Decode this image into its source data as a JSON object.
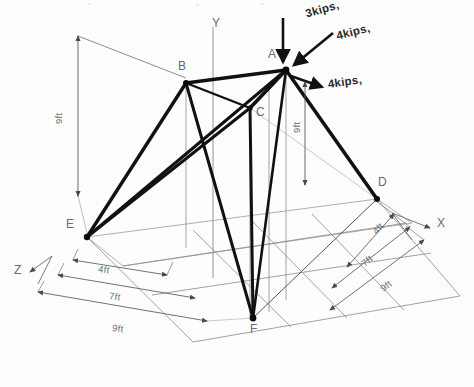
{
  "figure": {
    "type": "3d-space-truss-free-body-diagram",
    "background": "#fdfdfd",
    "member_color": "#111111",
    "grid_color": "#888888",
    "dim_color": "#5a5a5a"
  },
  "axes": [
    {
      "name": "y-axis",
      "label": "Y",
      "label_x": 212,
      "label_y": 22
    },
    {
      "name": "x-axis",
      "label": "X",
      "label_x": 437,
      "label_y": 223
    },
    {
      "name": "z-axis",
      "label": "Z",
      "label_x": 14,
      "label_y": 270
    }
  ],
  "nodes": [
    {
      "id": "A",
      "label": "A",
      "x": 286,
      "y": 70,
      "label_x": 268,
      "label_y": 54,
      "joint": true
    },
    {
      "id": "B",
      "label": "B",
      "x": 186,
      "y": 83,
      "label_x": 178,
      "label_y": 65,
      "joint": true
    },
    {
      "id": "C",
      "label": "C",
      "x": 250,
      "y": 108,
      "label_x": 256,
      "label_y": 110,
      "joint": true
    },
    {
      "id": "D",
      "label": "D",
      "x": 377,
      "y": 199,
      "label_x": 378,
      "label_y": 180,
      "joint": true
    },
    {
      "id": "E",
      "label": "E",
      "x": 87,
      "y": 237,
      "label_x": 68,
      "label_y": 222,
      "joint": true
    },
    {
      "id": "F",
      "label": "F",
      "x": 253,
      "y": 318,
      "label_x": 252,
      "label_y": 326,
      "joint": true
    }
  ],
  "members": [
    {
      "name": "member-B-A",
      "from": "B",
      "to": "A",
      "width": 3.4
    },
    {
      "name": "member-A-C",
      "from": "A",
      "to": "C",
      "width": 3.4
    },
    {
      "name": "member-B-C",
      "from": "B",
      "to": "C",
      "width": 2.6
    },
    {
      "name": "member-B-E",
      "from": "B",
      "to": "E",
      "width": 3.4
    },
    {
      "name": "member-B-F",
      "from": "B",
      "to": "F",
      "width": 3.0
    },
    {
      "name": "member-C-E",
      "from": "C",
      "to": "E",
      "width": 3.0
    },
    {
      "name": "member-C-F",
      "from": "C",
      "to": "F",
      "width": 3.0
    },
    {
      "name": "member-A-E",
      "from": "A",
      "to": "E",
      "width": 3.2
    },
    {
      "name": "member-A-F",
      "from": "A",
      "to": "F",
      "width": 3.0
    },
    {
      "name": "member-A-D",
      "from": "A",
      "to": "D",
      "width": 3.4
    },
    {
      "name": "member-D-F",
      "from": "D",
      "to": "F",
      "width": 1.1
    }
  ],
  "forces": [
    {
      "name": "force-3kips-vertical",
      "label": "3kips,",
      "label_x": 310,
      "label_y": 14,
      "tail_x": 283,
      "tail_y": 18,
      "head_x": 283,
      "head_y": 64,
      "direction": "downward-vertical"
    },
    {
      "name": "force-4kips-diagonal",
      "label": "4kips,",
      "label_x": 338,
      "label_y": 38,
      "tail_x": 331,
      "tail_y": 35,
      "head_x": 292,
      "head_y": 66,
      "direction": "down-left-diagonal"
    },
    {
      "name": "force-4kips-horizontal",
      "label": "4kips,",
      "label_x": 330,
      "label_y": 84,
      "tail_x": 290,
      "tail_y": 75,
      "head_x": 323,
      "head_y": 88,
      "direction": "outward-right"
    }
  ],
  "dimensions": [
    {
      "name": "dim-height-left-9ft",
      "label": "9ft",
      "label_x": 60,
      "label_y": 130,
      "orientation": "vertical-left",
      "value": 9,
      "unit": "ft"
    },
    {
      "name": "dim-height-A-9ft",
      "label": "9ft",
      "label_x": 295,
      "label_y": 139,
      "orientation": "vertical-inner",
      "value": 9,
      "unit": "ft"
    },
    {
      "name": "dim-front-4ft",
      "label": "4ft",
      "label_x": 99,
      "label_y": 268,
      "orientation": "z-front",
      "value": 4,
      "unit": "ft"
    },
    {
      "name": "dim-front-7ft",
      "label": "7ft",
      "label_x": 110,
      "label_y": 295,
      "orientation": "z-front",
      "value": 7,
      "unit": "ft"
    },
    {
      "name": "dim-front-9ft",
      "label": "9ft",
      "label_x": 114,
      "label_y": 327,
      "orientation": "z-front",
      "value": 9,
      "unit": "ft"
    },
    {
      "name": "dim-right-4ft",
      "label": "4ft",
      "label_x": 371,
      "label_y": 235,
      "orientation": "x-right",
      "value": 4,
      "unit": "ft"
    },
    {
      "name": "dim-right-7ft",
      "label": "7ft",
      "label_x": 361,
      "label_y": 266,
      "orientation": "x-right",
      "value": 7,
      "unit": "ft"
    },
    {
      "name": "dim-right-9ft",
      "label": "9ft",
      "label_x": 379,
      "label_y": 291,
      "orientation": "x-right",
      "value": 9,
      "unit": "ft"
    }
  ]
}
